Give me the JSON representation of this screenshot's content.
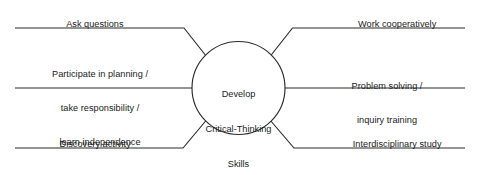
{
  "diagram": {
    "type": "spider-web-concept-map",
    "hub": {
      "line1": "Develop",
      "line2": "Critical-Thinking",
      "line3": "Skills"
    },
    "colors": {
      "background": "#ffffff",
      "stroke": "#2b2b2b",
      "text": "#1b1b1b"
    },
    "branches": {
      "left_top": {
        "label": "Ask questions"
      },
      "left_middle": {
        "line1": "Participate in planning /",
        "line2": "take responsibility /",
        "line3": "learn independence"
      },
      "left_bottom": {
        "label": "Discovery activity"
      },
      "right_top": {
        "label": "Work cooperatively"
      },
      "right_middle": {
        "line1": "Problem solving /",
        "line2": "inquiry training"
      },
      "right_bottom": {
        "label": "Interdisciplinary study"
      }
    }
  }
}
